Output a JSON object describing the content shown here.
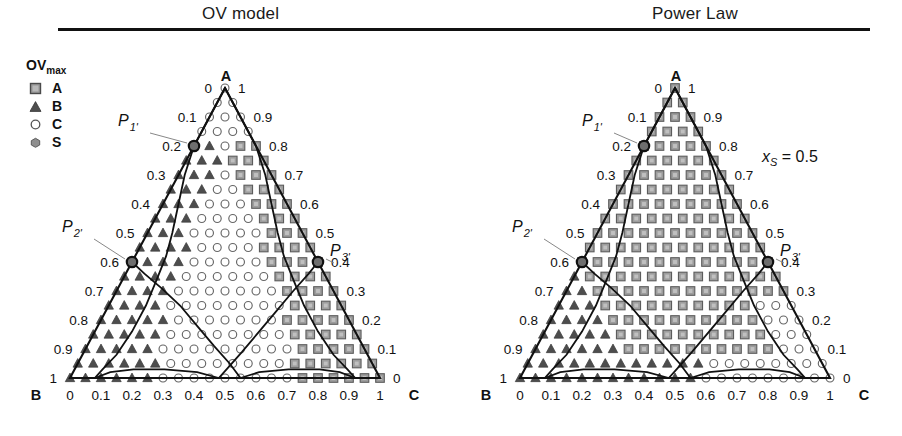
{
  "titles": {
    "left": "OV model",
    "right": "Power Law"
  },
  "legend": {
    "title": "OV",
    "title_sub": "max",
    "items": [
      {
        "marker": "square-marker",
        "label": "A",
        "color": "#8f8f8f"
      },
      {
        "marker": "triangle-marker",
        "label": "B",
        "color": "#595959"
      },
      {
        "marker": "circle-marker",
        "label": "C",
        "color": "#ffffff"
      },
      {
        "marker": "hexagon-marker",
        "label": "S",
        "color": "#8a8a8a"
      }
    ]
  },
  "annotations": {
    "xs": "x",
    "xs_sub": "S",
    "xs_value": " = 0.5"
  },
  "axes": {
    "vertex_a": "A",
    "vertex_b": "B",
    "vertex_c": "C",
    "left_ticks": [
      "0",
      "0.1",
      "0.2",
      "0.3",
      "0.4",
      "0.5",
      "0.6",
      "0.7",
      "0.8",
      "0.9",
      "1"
    ],
    "right_ticks": [
      "1",
      "0.9",
      "0.8",
      "0.7",
      "0.6",
      "0.5",
      "0.4",
      "0.3",
      "0.2",
      "0.1",
      "0"
    ],
    "bottom_ticks": [
      "0",
      "0.1",
      "0.2",
      "0.3",
      "0.4",
      "0.5",
      "0.6",
      "0.7",
      "0.8",
      "0.9",
      "1"
    ]
  },
  "point_labels": {
    "p1": "P",
    "p1_sub": "1'",
    "p2": "P",
    "p2_sub": "2'",
    "p3": "P",
    "p3_sub": "3'"
  },
  "chart_data": {
    "type": "scatter",
    "xlabel": "x_C",
    "ylabel": "x_B",
    "zlabel": "x_A",
    "axis_range": [
      0,
      1
    ],
    "grid_step": 0.05,
    "grid": false,
    "legend_position": "top-left",
    "panels": [
      {
        "name": "OV model",
        "marked_points": [
          {
            "label": "P1'",
            "xA": 0.8,
            "xB": 0.2,
            "xC": 0.0
          },
          {
            "label": "P2'",
            "xA": 0.4,
            "xB": 0.6,
            "xC": 0.0
          },
          {
            "label": "P3'",
            "xA": 0.4,
            "xB": 0.0,
            "xC": 0.6
          }
        ],
        "region_fractions": {
          "A": 0.17,
          "B": 0.17,
          "C": 0.66
        }
      },
      {
        "name": "Power Law",
        "xs": 0.5,
        "marked_points": [
          {
            "label": "P1'",
            "xA": 0.8,
            "xB": 0.2,
            "xC": 0.0
          },
          {
            "label": "P2'",
            "xA": 0.4,
            "xB": 0.6,
            "xC": 0.0
          },
          {
            "label": "P3'",
            "xA": 0.4,
            "xB": 0.0,
            "xC": 0.6
          }
        ],
        "region_fractions": {
          "A": 0.72,
          "B": 0.22,
          "C": 0.06
        }
      }
    ]
  }
}
